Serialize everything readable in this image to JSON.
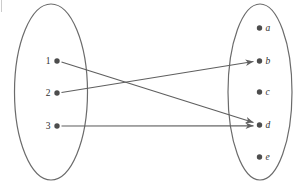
{
  "colors": {
    "background": "#ffffff",
    "outline": "#6b6b6b",
    "arrow": "#5f5f5f",
    "dot": "#4d4d4d",
    "text": "#2f2f2f",
    "artifact": "#cccccc"
  },
  "left_set": {
    "elements": [
      "1",
      "2",
      "3"
    ]
  },
  "right_set": {
    "elements": [
      "a",
      "b",
      "c",
      "d",
      "e"
    ]
  },
  "mappings": [
    {
      "from": "1",
      "to": "d"
    },
    {
      "from": "2",
      "to": "b"
    },
    {
      "from": "3",
      "to": "d"
    }
  ]
}
